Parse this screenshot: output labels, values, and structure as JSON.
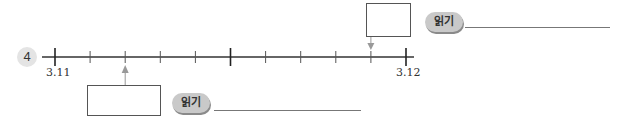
{
  "problem": {
    "number": "4",
    "number_line": {
      "start_label": "3.11",
      "end_label": "3.12",
      "start_value": 3.11,
      "end_value": 3.12,
      "subdivisions": 10,
      "major_tick_indices": [
        0,
        5,
        10
      ]
    },
    "markers": [
      {
        "name": "lower-marker",
        "tick_index": 2,
        "direction": "up",
        "read_label": "읽기",
        "box_value": "",
        "line_value": ""
      },
      {
        "name": "upper-marker",
        "tick_index": 9,
        "direction": "down",
        "read_label": "읽기",
        "box_value": "",
        "line_value": ""
      }
    ]
  }
}
